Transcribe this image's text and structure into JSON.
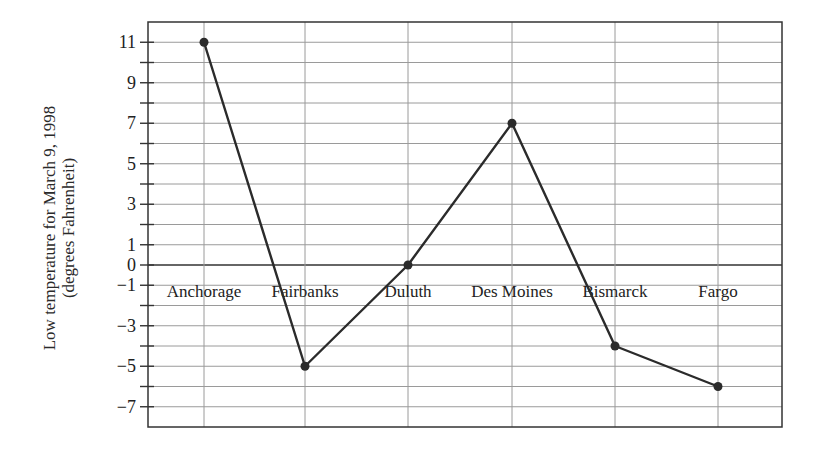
{
  "chart_data": {
    "type": "line",
    "title": "",
    "xlabel": "",
    "ylabel": "Low temperature for March 9, 1998 (degrees Fahrenheit)",
    "ylabel_lines": [
      "Low temperature for March 9, 1998",
      "(degrees Fahrenheit)"
    ],
    "categories": [
      "Anchorage",
      "Fairbanks",
      "Duluth",
      "Des Moines",
      "Bismarck",
      "Fargo"
    ],
    "values": [
      11,
      -5,
      0,
      7,
      -4,
      -6
    ],
    "yticks": [
      11,
      9,
      7,
      5,
      3,
      1,
      0,
      -1,
      -3,
      -5,
      -7
    ],
    "ylim": [
      -8,
      12
    ],
    "grid": true,
    "legend": null,
    "colors": {
      "line": "#2b2b2b",
      "grid": "#9a9a9a",
      "axis": "#333333",
      "text": "#222222"
    }
  }
}
